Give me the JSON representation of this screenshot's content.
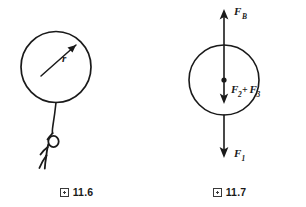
{
  "page": {
    "background": "#ffffff",
    "ink_color": "#1a1a1a",
    "width": 306,
    "height": 207
  },
  "figures": [
    {
      "id": "fig-11-6",
      "caption_glyph": "missing-cjk-box",
      "caption_text": "11.6",
      "description": "Balloon on a string held by a stick figure, radius arrow labeled r",
      "labels": {
        "radius": "r"
      }
    },
    {
      "id": "fig-11-7",
      "caption_glyph": "missing-cjk-box",
      "caption_text": "11.7",
      "description": "Free body diagram of balloon with buoyant force up, weight forces down",
      "labels": {
        "buoyant_main": "F",
        "buoyant_sub": "B",
        "center_first": "F",
        "center_first_sub": "2",
        "center_operator": "+",
        "center_second": "F",
        "center_second_sub": "3",
        "bottom_main": "F",
        "bottom_sub": "1"
      }
    }
  ]
}
